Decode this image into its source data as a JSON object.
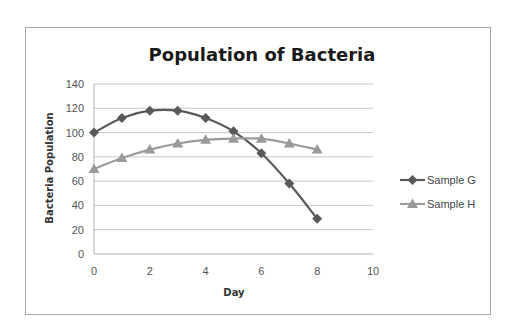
{
  "chart_data": {
    "type": "line",
    "title": "Population of Bacteria",
    "xlabel": "Day",
    "ylabel": "Bacteria Population",
    "xlim": [
      0,
      10
    ],
    "ylim": [
      0,
      140
    ],
    "x_ticks": [
      0,
      2,
      4,
      6,
      8,
      10
    ],
    "y_ticks": [
      0,
      20,
      40,
      60,
      80,
      100,
      120,
      140
    ],
    "grid": "horizontal",
    "legend_position": "right",
    "x": [
      0,
      1,
      2,
      3,
      4,
      5,
      6,
      7,
      8
    ],
    "series": [
      {
        "name": "Sample G",
        "marker": "diamond",
        "color": "#595959",
        "values": [
          100,
          112,
          118,
          118,
          112,
          101,
          83,
          58,
          29
        ]
      },
      {
        "name": "Sample H",
        "marker": "triangle",
        "color": "#9a9a9a",
        "values": [
          70,
          79,
          86,
          91,
          94,
          95,
          95,
          91,
          86
        ]
      }
    ]
  }
}
